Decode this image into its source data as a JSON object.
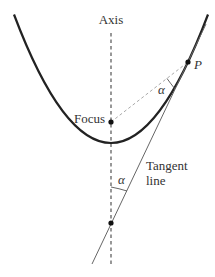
{
  "diagram": {
    "labels": {
      "axis": "Axis",
      "focus": "Focus",
      "point": "P",
      "angle_top": "α",
      "angle_bottom": "α",
      "tangent_line_1": "Tangent",
      "tangent_line_2": "line"
    },
    "colors": {
      "curve": "#222222",
      "axis": "#444444",
      "dashed_segment": "#aaaaaa",
      "tangent": "#666666",
      "text": "#333333",
      "point": "#111111"
    }
  }
}
